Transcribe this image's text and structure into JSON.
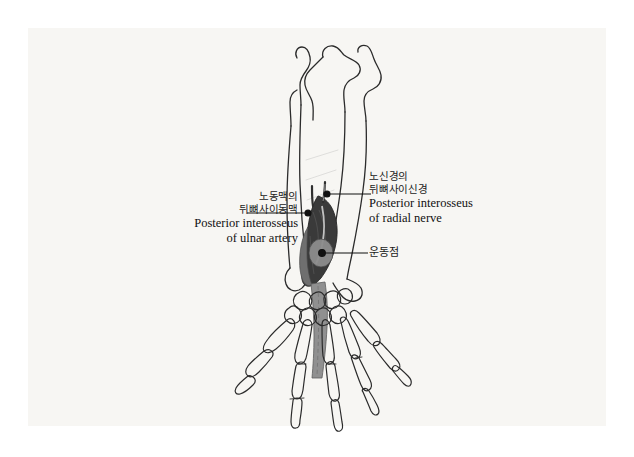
{
  "document": {
    "type": "anatomical-illustration",
    "subject": "Forearm and hand skeleton, posterior view, with posterior interosseous nerve and artery",
    "page_background": "#ffffff",
    "plate_background": "#f7f6f3"
  },
  "labels": {
    "ulnar_artery": {
      "korean_line1": "노동맥의",
      "korean_line2": "뒤뼈사이동맥",
      "english_line1": "Posterior interosseus",
      "english_line2": "of ulnar artery"
    },
    "radial_nerve": {
      "korean_line1": "노신경의",
      "korean_line2": "뒤뼈사이신경",
      "english_line1": "Posterior interosseus",
      "english_line2": "of radial nerve"
    },
    "motor_point": {
      "korean_line1": "운동점"
    }
  },
  "colors": {
    "bone_outline": "#2b2b2b",
    "muscle_dark": "#3a3a3a",
    "muscle_mid": "#6f6f6f",
    "tendon_grey": "#8a8a8a",
    "leader_line": "#111111",
    "text": "#111111"
  },
  "leaders": {
    "ulnar_artery_point": {
      "x": 308,
      "y": 213
    },
    "radial_nerve_point": {
      "x": 327,
      "y": 194
    },
    "motor_point_point": {
      "x": 322,
      "y": 253
    }
  }
}
